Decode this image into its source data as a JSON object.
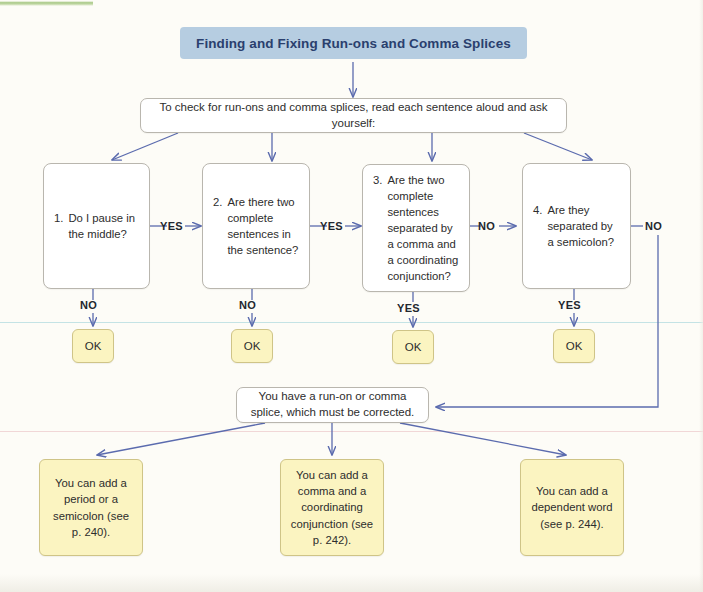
{
  "title_banner": {
    "text": "Finding and Fixing Run-ons and Comma Splices"
  },
  "instruction": {
    "text": "To check for run-ons and comma splices, read each sentence aloud and ask  yourself:"
  },
  "questions": [
    {
      "number": "1.",
      "text": "Do I pause in the middle?",
      "yes_label": "YES",
      "no_label": "NO"
    },
    {
      "number": "2.",
      "text": "Are there two complete sentences in the sentence?",
      "yes_label": "YES",
      "no_label": "NO"
    },
    {
      "number": "3.",
      "text": "Are the two complete sentences separated by a comma and a coordinating conjunction?",
      "yes_label": "YES",
      "no_label": "NO"
    },
    {
      "number": "4.",
      "text": "Are they separated by a semicolon?",
      "yes_label": "YES",
      "no_label": "NO"
    }
  ],
  "ok_boxes": [
    {
      "label": "OK",
      "from_branch": "NO"
    },
    {
      "label": "OK",
      "from_branch": "NO"
    },
    {
      "label": "OK",
      "from_branch": "YES"
    },
    {
      "label": "OK",
      "from_branch": "YES"
    }
  ],
  "branch_labels": {
    "q1_to_q2": "YES",
    "q2_to_q3": "YES",
    "q3_to_q4": "NO",
    "q4_to_result": "NO",
    "q1_down": "NO",
    "q2_down": "NO",
    "q3_down": "YES",
    "q4_down": "YES"
  },
  "result": {
    "text": "You have a run-on or comma splice, which must be corrected."
  },
  "solutions": [
    {
      "text": "You can add a period or a semicolon (see p. 240)."
    },
    {
      "text": "You can add a comma and a coordinating conjunction (see p. 242)."
    },
    {
      "text": "You can add a dependent word (see p. 244)."
    }
  ],
  "colors": {
    "banner_bg": "#b6cde1",
    "banner_text": "#2a3f6e",
    "box_border": "#b9b6ae",
    "yellow_bg": "#fbf4c1",
    "yellow_border": "#cfc487",
    "arrow": "#5b6bae",
    "page_bg": "#fdfcf7"
  }
}
